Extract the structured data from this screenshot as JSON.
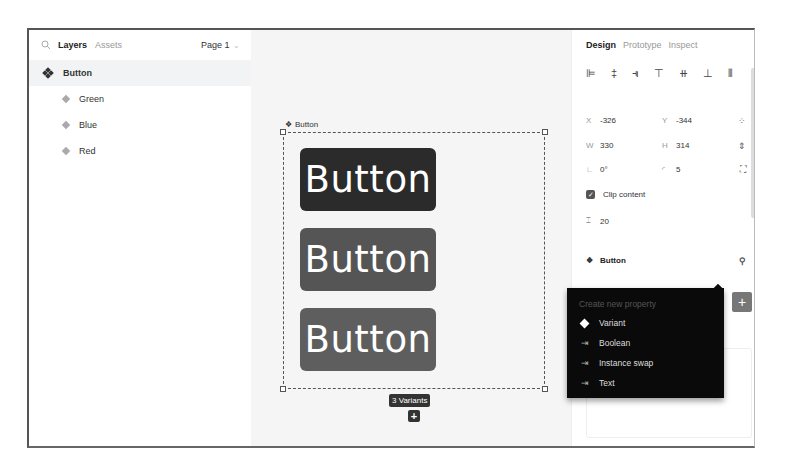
{
  "left_panel": {
    "tabs": [
      {
        "label": "Layers",
        "active": true
      },
      {
        "label": "Assets",
        "active": false
      }
    ],
    "page_selector": "Page 1",
    "layers": [
      {
        "name": "Button",
        "type": "component-set",
        "selected": true
      },
      {
        "name": "Green",
        "type": "variant"
      },
      {
        "name": "Blue",
        "type": "variant"
      },
      {
        "name": "Red",
        "type": "variant"
      }
    ]
  },
  "canvas": {
    "frame_label": "Button",
    "variants": [
      {
        "label": "Button",
        "color": "#2b2b2b"
      },
      {
        "label": "Button",
        "color": "#555555"
      },
      {
        "label": "Button",
        "color": "#5e5e5e"
      }
    ],
    "variants_badge": "3 Variants",
    "add_variant_icon": "+"
  },
  "right_panel": {
    "tabs": [
      {
        "label": "Design",
        "active": true
      },
      {
        "label": "Prototype",
        "active": false
      },
      {
        "label": "Inspect",
        "active": false
      }
    ],
    "alignment_icons": [
      "align-left",
      "align-h-center",
      "align-right",
      "align-top",
      "align-v-center",
      "align-bottom",
      "distribute"
    ],
    "x": {
      "label": "X",
      "value": "-326"
    },
    "y": {
      "label": "Y",
      "value": "-344"
    },
    "w": {
      "label": "W",
      "value": "330"
    },
    "h": {
      "label": "H",
      "value": "314"
    },
    "rotation": {
      "label": "∟",
      "value": "0°"
    },
    "radius": {
      "label": "◜",
      "value": "5"
    },
    "clip_content": {
      "label": "Clip content",
      "checked": true
    },
    "spacing": {
      "value": "20"
    },
    "component": {
      "label": "Button"
    },
    "properties": {
      "title": "Properties",
      "add_icon": "+"
    }
  },
  "dropdown": {
    "title": "Create new property",
    "items": [
      {
        "label": "Variant",
        "icon": "diamond-icon"
      },
      {
        "label": "Boolean",
        "icon": "property-icon"
      },
      {
        "label": "Instance swap",
        "icon": "property-icon"
      },
      {
        "label": "Text",
        "icon": "property-icon"
      }
    ]
  }
}
